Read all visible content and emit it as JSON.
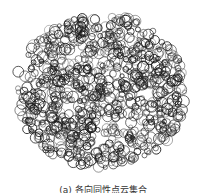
{
  "figure": {
    "disc": {
      "cx": 101,
      "cy": 91,
      "rx": 90,
      "ry": 81
    },
    "stroke_color": "#1a1a1a",
    "background": "#ffffff",
    "circle_count": 900
  },
  "caption": {
    "text": "(a) 各向同性点云集合"
  }
}
